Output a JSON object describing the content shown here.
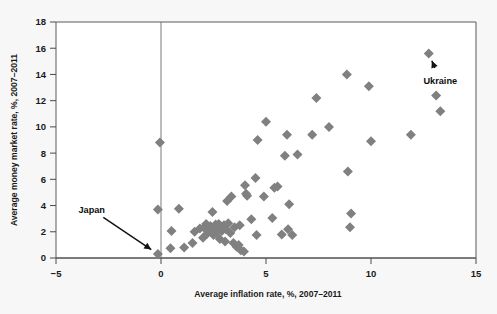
{
  "chart_data": {
    "type": "scatter",
    "title": "",
    "xlabel": "Average inflation rate, %, 2007–2011",
    "ylabel": "Average money market rate, %, 2007–2011",
    "xlim": [
      -5,
      15
    ],
    "ylim": [
      0,
      18
    ],
    "xticks": [
      -5,
      0,
      5,
      10,
      15
    ],
    "xtick_labels": [
      "−5",
      "0",
      "5",
      "10",
      "15"
    ],
    "yticks": [
      0,
      2,
      4,
      6,
      8,
      10,
      12,
      14,
      16,
      18
    ],
    "ytick_labels": [
      "0",
      "2",
      "4",
      "6",
      "8",
      "10",
      "12",
      "14",
      "16",
      "18"
    ],
    "grid": false,
    "legend": "none",
    "marker": "diamond",
    "marker_color": "#808080",
    "reference_line_x": 0,
    "annotations": [
      {
        "label": "Japan",
        "point": [
          -0.15,
          0.3
        ],
        "text_x": -3.3,
        "text_y": 3.7
      },
      {
        "label": "Ukraine",
        "point": [
          12.75,
          15.6
        ],
        "text_x": 13.3,
        "text_y": 13.5
      }
    ],
    "points": [
      [
        -0.15,
        0.3
      ],
      [
        -0.05,
        8.8
      ],
      [
        -0.15,
        3.7
      ],
      [
        0.45,
        0.75
      ],
      [
        0.5,
        2.05
      ],
      [
        0.85,
        3.75
      ],
      [
        1.1,
        0.8
      ],
      [
        1.5,
        1.15
      ],
      [
        1.6,
        2.0
      ],
      [
        1.85,
        2.25
      ],
      [
        2.0,
        1.55
      ],
      [
        2.05,
        2.3
      ],
      [
        2.15,
        2.6
      ],
      [
        2.2,
        1.85
      ],
      [
        2.3,
        2.15
      ],
      [
        2.35,
        2.45
      ],
      [
        2.4,
        2.0
      ],
      [
        2.45,
        3.5
      ],
      [
        2.5,
        1.75
      ],
      [
        2.55,
        2.3
      ],
      [
        2.6,
        2.55
      ],
      [
        2.65,
        1.9
      ],
      [
        2.7,
        2.2
      ],
      [
        2.75,
        2.6
      ],
      [
        2.8,
        1.45
      ],
      [
        2.85,
        2.35
      ],
      [
        2.9,
        2.05
      ],
      [
        3.0,
        2.5
      ],
      [
        3.05,
        1.25
      ],
      [
        3.1,
        2.2
      ],
      [
        3.15,
        4.35
      ],
      [
        3.2,
        2.65
      ],
      [
        3.3,
        1.9
      ],
      [
        3.35,
        4.7
      ],
      [
        3.45,
        1.15
      ],
      [
        3.5,
        2.35
      ],
      [
        3.6,
        0.85
      ],
      [
        3.7,
        1.0
      ],
      [
        3.75,
        2.5
      ],
      [
        3.8,
        0.6
      ],
      [
        3.95,
        0.5
      ],
      [
        4.0,
        5.55
      ],
      [
        4.05,
        4.9
      ],
      [
        4.1,
        4.75
      ],
      [
        4.3,
        2.95
      ],
      [
        4.5,
        6.1
      ],
      [
        4.55,
        1.75
      ],
      [
        4.6,
        9.0
      ],
      [
        4.9,
        4.7
      ],
      [
        5.0,
        10.4
      ],
      [
        5.3,
        3.05
      ],
      [
        5.4,
        5.35
      ],
      [
        5.55,
        5.45
      ],
      [
        5.75,
        1.8
      ],
      [
        5.9,
        7.8
      ],
      [
        6.0,
        9.4
      ],
      [
        6.05,
        2.2
      ],
      [
        6.1,
        4.1
      ],
      [
        6.25,
        1.75
      ],
      [
        6.5,
        7.9
      ],
      [
        7.2,
        9.4
      ],
      [
        7.4,
        12.2
      ],
      [
        8.0,
        10.0
      ],
      [
        8.85,
        14.0
      ],
      [
        8.9,
        6.6
      ],
      [
        9.0,
        2.35
      ],
      [
        9.05,
        3.4
      ],
      [
        9.9,
        13.1
      ],
      [
        10.0,
        8.9
      ],
      [
        11.9,
        9.4
      ],
      [
        12.75,
        15.6
      ],
      [
        13.1,
        12.4
      ],
      [
        13.3,
        11.2
      ]
    ]
  }
}
